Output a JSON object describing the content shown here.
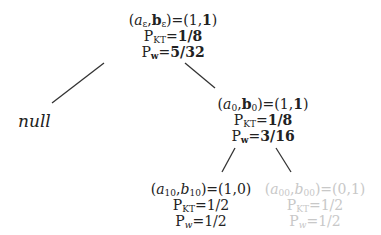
{
  "nodes": {
    "root": {
      "label": "(aε,bε)=(1,1)",
      "a": "a",
      "a_sub": "ε",
      "b": "b",
      "b_sub": "ε",
      "eq": ")=(1,",
      "val2": "1",
      "close": ")",
      "pkt_prefix": "P",
      "pkt_sub": "KT",
      "pkt_value": "1/8",
      "pw_prefix": "P",
      "pw_sub": "w",
      "pw_value": "5/32"
    },
    "null_leaf": {
      "label": "null"
    },
    "n0": {
      "a": "a",
      "a_sub": "0",
      "b": "b",
      "b_sub": "0",
      "eq": ")=(1,",
      "val2": "1",
      "close": ")",
      "pkt_prefix": "P",
      "pkt_sub": "KT",
      "pkt_value": "1/8",
      "pw_prefix": "P",
      "pw_sub": "w",
      "pw_value": "3/16"
    },
    "n10": {
      "a": "a",
      "a_sub": "10",
      "b": "b",
      "b_sub": "10",
      "tail": ")=(1,0)",
      "pkt_prefix": "P",
      "pkt_sub": "KT",
      "pkt_value": "=1/2",
      "pw_prefix": "P",
      "pw_sub": "w",
      "pw_value": "=1/2"
    },
    "n00": {
      "a": "a",
      "a_sub": "00",
      "b": "b",
      "b_sub": "00",
      "tail": ")=(0,1)",
      "pkt_prefix": "P",
      "pkt_sub": "KT",
      "pkt_value": "=1/2",
      "pw_prefix": "P",
      "pw_sub": "w",
      "pw_value": "=1/2"
    }
  },
  "colors": {
    "ink": "#222222",
    "faded": "#c8c8c8",
    "edge": "#333333"
  }
}
